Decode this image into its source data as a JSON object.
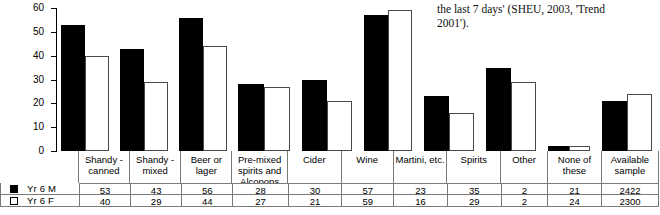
{
  "caption": {
    "line1": "the last 7 days' (SHEU, 2003, 'Trend",
    "line2": "2001')."
  },
  "legend": {
    "series": [
      {
        "key": "m",
        "label": "Yr 6 M",
        "swatch": "filled-square-icon",
        "color": "#000000"
      },
      {
        "key": "f",
        "label": "Yr 6 F",
        "swatch": "hollow-square-icon",
        "color": "#ffffff"
      }
    ]
  },
  "axis": {
    "ticks": [
      "60",
      "50",
      "40",
      "30",
      "20",
      "10",
      "0"
    ],
    "ymin": 0,
    "ymax": 60
  },
  "table": {
    "available_header_line1": "Available",
    "available_header_line2": "sample",
    "available_sample": [
      "2422",
      "2300"
    ]
  },
  "chart_data": {
    "type": "bar",
    "title": "",
    "xlabel": "",
    "ylabel": "",
    "ylim": [
      0,
      60
    ],
    "yticks": [
      0,
      10,
      20,
      30,
      40,
      50,
      60
    ],
    "grid": false,
    "legend_position": "table-left",
    "categories": [
      "Shandy - canned",
      "Shandy - mixed",
      "Beer or lager",
      "Pre-mixed spirits and Alcopops",
      "Cider",
      "Wine",
      "Martini, etc.",
      "Spirits",
      "Other",
      "None of these"
    ],
    "category_lines": [
      [
        "Shandy -",
        "canned"
      ],
      [
        "Shandy -",
        "mixed"
      ],
      [
        "Beer or lager"
      ],
      [
        "Pre-mixed",
        "spirits and",
        "Alcopops"
      ],
      [
        "Cider"
      ],
      [
        "Wine"
      ],
      [
        "Martini, etc."
      ],
      [
        "Spirits"
      ],
      [
        "Other"
      ],
      [
        "None of these"
      ]
    ],
    "series": [
      {
        "name": "Yr 6 M",
        "values": [
          53,
          43,
          56,
          28,
          30,
          57,
          23,
          35,
          2,
          21
        ],
        "available_sample": 2422
      },
      {
        "name": "Yr 6 F",
        "values": [
          40,
          29,
          44,
          27,
          21,
          59,
          16,
          29,
          2,
          24
        ],
        "available_sample": 2300
      }
    ]
  }
}
